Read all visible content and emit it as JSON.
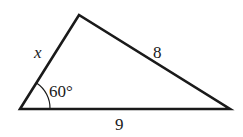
{
  "diagram": {
    "type": "triangle",
    "vertices": {
      "bottom_left": [
        20,
        109
      ],
      "top": [
        79,
        15
      ],
      "bottom_right": [
        230,
        109
      ]
    },
    "labels": {
      "left_side": "x",
      "right_side": "8",
      "bottom_side": "9",
      "angle": "60°"
    },
    "stroke_color": "#1a1a1a"
  }
}
